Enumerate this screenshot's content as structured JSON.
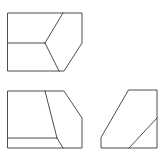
{
  "diagram": {
    "type": "orthographic-views",
    "stroke_color": "#3a3a3a",
    "background": "#ffffff",
    "views": [
      {
        "name": "top-view",
        "outline": [
          [
            8,
            13
          ],
          [
            82,
            13
          ],
          [
            82,
            43
          ],
          [
            64,
            71
          ],
          [
            8,
            71
          ]
        ],
        "lines": [
          [
            [
              63,
              13
            ],
            [
              45,
              43
            ]
          ],
          [
            [
              8,
              43
            ],
            [
              45,
              43
            ]
          ],
          [
            [
              45,
              43
            ],
            [
              59,
              71
            ]
          ]
        ]
      },
      {
        "name": "front-view",
        "outline": [
          [
            8,
            91
          ],
          [
            64,
            91
          ],
          [
            82,
            118
          ],
          [
            82,
            148
          ],
          [
            8,
            148
          ]
        ],
        "lines": [
          [
            [
              45,
              91
            ],
            [
              57,
              138
            ]
          ],
          [
            [
              57,
              138
            ],
            [
              63,
              148
            ]
          ],
          [
            [
              8,
              138
            ],
            [
              57,
              138
            ]
          ]
        ]
      },
      {
        "name": "side-view",
        "outline": [
          [
            129,
            90
          ],
          [
            157,
            90
          ],
          [
            157,
            148
          ],
          [
            101,
            148
          ],
          [
            101,
            138
          ]
        ],
        "lines": [
          [
            [
              129,
              148
            ],
            [
              157,
              118
            ]
          ]
        ]
      }
    ]
  }
}
